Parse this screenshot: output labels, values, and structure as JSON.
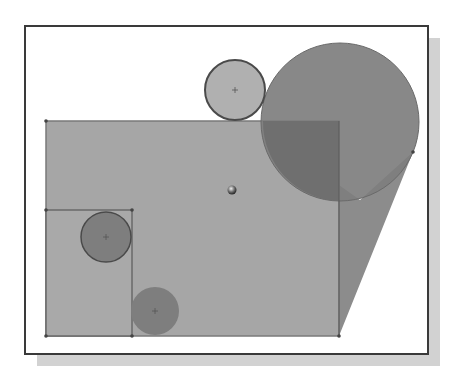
{
  "diagram": {
    "type": "cad-sketch",
    "colors": {
      "background": "#ffffff",
      "frame_border": "#3a3a3a",
      "shadow": "#d2d2d2",
      "region_fill": "#a6a6a6",
      "region_edge": "#7a7a7a",
      "big_circle_fill": "#7e7e7e",
      "overlap_fill": "#6f6f6f",
      "wedge_fill": "#8c8c8c",
      "small_circle_fill": "#7e7e7e",
      "light_circle_fill": "#b0b0b0",
      "circle_stroke": "#4a4a4a",
      "center_mark": "#555555"
    },
    "frame": {
      "x": 25,
      "y": 26,
      "w": 403,
      "h": 328,
      "shadow_offset": 12
    },
    "shapes": [
      {
        "id": "large-rectangle",
        "kind": "rect",
        "x": 46,
        "y": 121,
        "w": 293,
        "h": 215
      },
      {
        "id": "small-rectangle",
        "kind": "rect",
        "x": 46,
        "y": 210,
        "w": 86,
        "h": 126
      },
      {
        "id": "top-small-circle",
        "kind": "circle",
        "cx": 235,
        "cy": 90,
        "r": 30
      },
      {
        "id": "large-circle",
        "kind": "circle",
        "cx": 340,
        "cy": 122,
        "r": 79
      },
      {
        "id": "tangent-wedge",
        "kind": "polygon",
        "points": "339,336 339,190 413,152"
      },
      {
        "id": "inner-circle",
        "kind": "circle",
        "cx": 106,
        "cy": 237,
        "r": 25
      },
      {
        "id": "bottom-circle",
        "kind": "circle",
        "cx": 155,
        "cy": 311,
        "r": 24
      },
      {
        "id": "center-point",
        "kind": "point",
        "cx": 232,
        "cy": 190
      }
    ]
  }
}
